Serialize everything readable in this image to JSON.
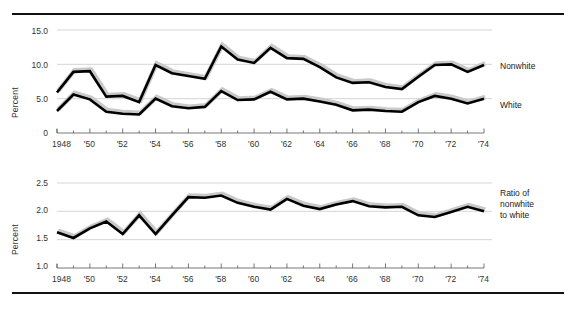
{
  "figure": {
    "background_color": "#ffffff",
    "line_color": "#000000",
    "shadow_color": "#c9c9c9",
    "grid_color": "#b8b8b8",
    "rule_top_label": "top-rule",
    "rule_bottom_label": "bottom-rule"
  },
  "chart_data": [
    {
      "type": "line",
      "title": "",
      "xlabel": "",
      "ylabel": "Percent",
      "xlim": [
        1948,
        1974
      ],
      "ylim": [
        0,
        15
      ],
      "yticks": [
        0,
        5,
        10,
        15
      ],
      "ytick_labels": [
        "0",
        "5.0",
        "10.0",
        "15.0"
      ],
      "grid": true,
      "legend_position": "right-of-plot",
      "x": [
        1948,
        1949,
        1950,
        1951,
        1952,
        1953,
        1954,
        1955,
        1956,
        1957,
        1958,
        1959,
        1960,
        1961,
        1962,
        1963,
        1964,
        1965,
        1966,
        1967,
        1968,
        1969,
        1970,
        1971,
        1972,
        1973,
        1974
      ],
      "xtick_labels": [
        "1948",
        "",
        "'50",
        "",
        "'52",
        "",
        "'54",
        "",
        "'56",
        "",
        "'58",
        "",
        "'60",
        "",
        "'62",
        "",
        "'64",
        "",
        "'66",
        "",
        "'68",
        "",
        "'70",
        "",
        "'72",
        "",
        "'74"
      ],
      "series": [
        {
          "name": "Nonwhite",
          "values": [
            5.9,
            8.9,
            9.0,
            5.3,
            5.4,
            4.5,
            9.9,
            8.7,
            8.3,
            7.9,
            12.6,
            10.7,
            10.2,
            12.4,
            10.9,
            10.8,
            9.6,
            8.1,
            7.3,
            7.4,
            6.7,
            6.4,
            8.2,
            9.9,
            10.0,
            8.9,
            9.9
          ]
        },
        {
          "name": "White",
          "values": [
            3.2,
            5.6,
            4.9,
            3.1,
            2.8,
            2.7,
            5.0,
            3.9,
            3.6,
            3.8,
            6.1,
            4.8,
            4.9,
            6.0,
            4.9,
            5.0,
            4.6,
            4.1,
            3.3,
            3.4,
            3.2,
            3.1,
            4.5,
            5.4,
            5.0,
            4.3,
            5.0
          ]
        }
      ]
    },
    {
      "type": "line",
      "title": "",
      "xlabel": "",
      "ylabel": "Percent",
      "xlim": [
        1948,
        1974
      ],
      "ylim": [
        1.0,
        2.5
      ],
      "yticks": [
        1.0,
        1.5,
        2.0,
        2.5
      ],
      "ytick_labels": [
        "1.0",
        "1.5",
        "2.0",
        "2.5"
      ],
      "grid": true,
      "legend_position": "right-of-plot",
      "x": [
        1948,
        1949,
        1950,
        1951,
        1952,
        1953,
        1954,
        1955,
        1956,
        1957,
        1958,
        1959,
        1960,
        1961,
        1962,
        1963,
        1964,
        1965,
        1966,
        1967,
        1968,
        1969,
        1970,
        1971,
        1972,
        1973,
        1974
      ],
      "xtick_labels": [
        "1948",
        "",
        "'50",
        "",
        "'52",
        "",
        "'54",
        "",
        "'56",
        "",
        "'58",
        "",
        "'60",
        "",
        "'62",
        "",
        "'64",
        "",
        "'66",
        "",
        "'68",
        "",
        "'70",
        "",
        "'72",
        "",
        "'74"
      ],
      "series": [
        {
          "name": "Ratio of nonwhite to white",
          "values": [
            1.63,
            1.53,
            1.7,
            1.82,
            1.6,
            1.93,
            1.6,
            1.93,
            2.25,
            2.24,
            2.28,
            2.15,
            2.08,
            2.03,
            2.22,
            2.1,
            2.04,
            2.12,
            2.18,
            2.09,
            2.07,
            2.08,
            1.93,
            1.9,
            1.99,
            2.08,
            2.0
          ]
        }
      ]
    }
  ],
  "top_chart": {
    "ylabel": "Percent",
    "ytick_labels": [
      "15.0",
      "10.0",
      "5.0",
      "0"
    ],
    "xtick_labels": [
      "1948",
      "'50",
      "'52",
      "'54",
      "'56",
      "'58",
      "'60",
      "'62",
      "'64",
      "'66",
      "'68",
      "'70",
      "'72",
      "'74"
    ],
    "label_nonwhite": "Nonwhite",
    "label_white": "White"
  },
  "bottom_chart": {
    "ylabel": "Percent",
    "ytick_labels": [
      "2.5",
      "2.0",
      "1.5",
      "1.0"
    ],
    "xtick_labels": [
      "1948",
      "'50",
      "'52",
      "'54",
      "'56",
      "'58",
      "'60",
      "'62",
      "'64",
      "'66",
      "'68",
      "'70",
      "'72",
      "'74"
    ],
    "label_ratio_line1": "Ratio of",
    "label_ratio_line2": "nonwhite",
    "label_ratio_line3": "to white"
  }
}
